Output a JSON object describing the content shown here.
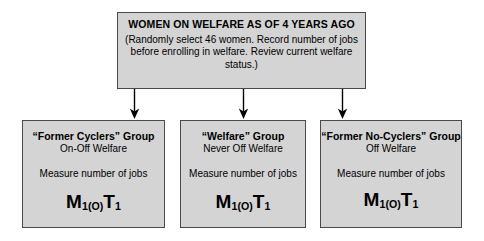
{
  "diagram": {
    "type": "flowchart",
    "root": {
      "title": "WOMEN ON WELFARE AS OF 4 YEARS AGO",
      "description": "(Randomly select 46 women. Record number of jobs before enrolling in welfare. Review current welfare status.)"
    },
    "branches": [
      {
        "group_name": "“Former Cyclers” Group",
        "status": "On-Off Welfare",
        "measure": "Measure number of jobs",
        "notation": {
          "measure_symbol": "M",
          "measure_subscript": "1(O)",
          "treatment_symbol": "T",
          "treatment_subscript": "1",
          "full": "M1(O)T1"
        }
      },
      {
        "group_name": "“Welfare” Group",
        "status": "Never Off Welfare",
        "measure": "Measure number of jobs",
        "notation": {
          "measure_symbol": "M",
          "measure_subscript": "1(O)",
          "treatment_symbol": "T",
          "treatment_subscript": "1",
          "full": "M1(O)T1"
        }
      },
      {
        "group_name": "“Former No-Cyclers” Group",
        "status": "Off Welfare",
        "measure": "Measure number of jobs",
        "notation": {
          "measure_symbol": "M",
          "measure_subscript": "1(O)",
          "treatment_symbol": "T",
          "treatment_subscript": "1",
          "full": "M1(O)T1"
        }
      }
    ],
    "style": {
      "box_fill": "#d4d4d4",
      "box_border": "#4a4a4a",
      "connector_color": "#000000",
      "page_background": "#ffffff"
    }
  }
}
